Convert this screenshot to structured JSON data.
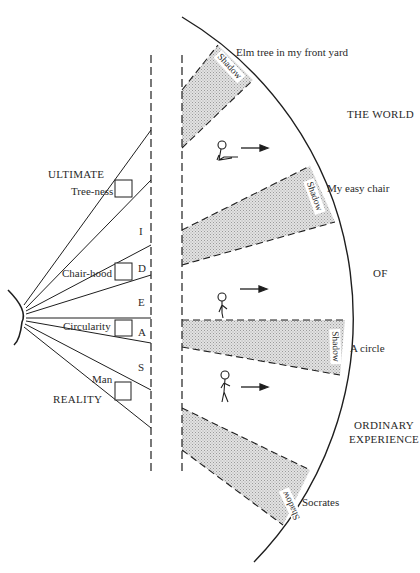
{
  "title_right": {
    "line1": "THE WORLD",
    "line2": "OF",
    "line3a": "ORDINARY",
    "line3b": "EXPERIENCE"
  },
  "title_left": {
    "top": "ULTIMATE",
    "bottom": "REALITY"
  },
  "divider_letters": [
    "I",
    "D",
    "E",
    "A",
    "S"
  ],
  "forms": [
    {
      "label": "Tree-ness"
    },
    {
      "label": "Chair-hood"
    },
    {
      "label": "Circularity"
    },
    {
      "label": "Man"
    }
  ],
  "objects": [
    {
      "label": "Elm tree in my front yard",
      "shadow": "Shadow"
    },
    {
      "label": "My easy chair",
      "shadow": "Shadow"
    },
    {
      "label": "A circle",
      "shadow": "Shadow"
    },
    {
      "label": "Socrates",
      "shadow": "Shadow"
    }
  ],
  "figures": [
    {
      "pose": "sitting",
      "icon": "sitting-person-icon"
    },
    {
      "pose": "standing",
      "icon": "standing-person-icon"
    },
    {
      "pose": "walking",
      "icon": "walking-person-icon"
    }
  ],
  "colors": {
    "line": "#1e1e1e",
    "shadow_fill": "#d4d4d4",
    "text": "#2a2a2a"
  }
}
